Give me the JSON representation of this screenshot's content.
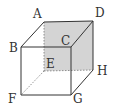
{
  "diagram": {
    "type": "cube",
    "colors": {
      "edge": "#333333",
      "hidden_edge": "#777777",
      "shaded_face": "#d4d4d4",
      "background": "#ffffff"
    },
    "shaded_face": [
      "A",
      "D",
      "H",
      "E"
    ],
    "vertices": {
      "A": {
        "label": "A",
        "x": 44,
        "y": 22
      },
      "B": {
        "label": "B",
        "x": 21,
        "y": 47
      },
      "C": {
        "label": "C",
        "x": 71,
        "y": 47
      },
      "D": {
        "label": "D",
        "x": 93,
        "y": 21
      },
      "E": {
        "label": "E",
        "x": 44,
        "y": 71
      },
      "F": {
        "label": "F",
        "x": 21,
        "y": 95
      },
      "G": {
        "label": "G",
        "x": 71,
        "y": 95
      },
      "H": {
        "label": "H",
        "x": 93,
        "y": 70
      }
    },
    "solid_edges": [
      "AB",
      "AD",
      "BC",
      "CD",
      "BF",
      "CG",
      "FG",
      "GH",
      "DH"
    ],
    "hidden_edges": [
      "AE",
      "EF",
      "EH"
    ]
  }
}
